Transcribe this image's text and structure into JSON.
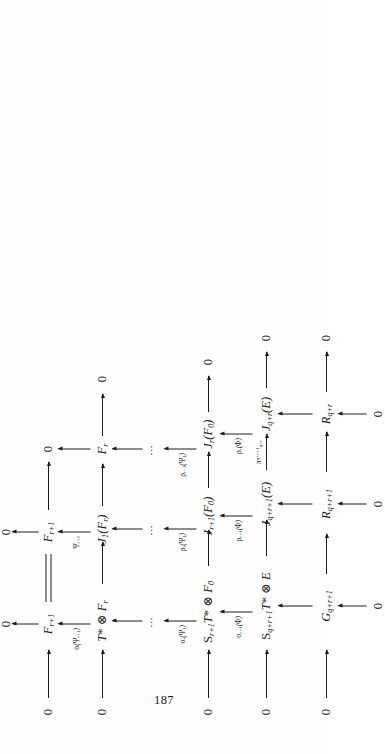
{
  "document": {
    "kind": "mathematical-commutative-diagram",
    "page_number": "187",
    "orientation": "rotated-90-ccw",
    "ink_color": "#1c1c1c",
    "paper_color": "#fefefe"
  },
  "diagram": {
    "rows": 5,
    "columns": 5,
    "zero_label": "0",
    "vdots_label": "⋯",
    "row_top": {
      "name": "row-F-r-plus-1",
      "nodes": [
        "0",
        "F_{r+1}",
        "F_{r+1}",
        "0"
      ],
      "node_plain": [
        "0",
        "F",
        "F",
        "0"
      ]
    },
    "nodes": [
      {
        "id": "n-r1-c1",
        "row": 1,
        "col": 1,
        "text": "0"
      },
      {
        "id": "n-r1-c2",
        "row": 1,
        "col": 2,
        "text": "F_{r+1}"
      },
      {
        "id": "n-r1-c3",
        "row": 1,
        "col": 3,
        "text": "F_{r+1}"
      },
      {
        "id": "n-r1-c4",
        "row": 1,
        "col": 4,
        "text": "0"
      },
      {
        "id": "n-r2-c1",
        "row": 2,
        "col": 1,
        "text": "0"
      },
      {
        "id": "n-r2-c2",
        "row": 2,
        "col": 2,
        "text": "T* ⊗ F_r"
      },
      {
        "id": "n-r2-c3",
        "row": 2,
        "col": 3,
        "text": "J_1(F_r)"
      },
      {
        "id": "n-r2-c4",
        "row": 2,
        "col": 4,
        "text": "F_r"
      },
      {
        "id": "n-r2-c5",
        "row": 2,
        "col": 5,
        "text": "0"
      },
      {
        "id": "n-r3-c1",
        "row": 3,
        "col": 1,
        "text": "0"
      },
      {
        "id": "n-r3-c2",
        "row": 3,
        "col": 2,
        "text": "S_{r+1}T* ⊗ F_0"
      },
      {
        "id": "n-r3-c3",
        "row": 3,
        "col": 3,
        "text": "J_{r+1}(F_0)"
      },
      {
        "id": "n-r3-c4",
        "row": 3,
        "col": 4,
        "text": "J_r(F_0)"
      },
      {
        "id": "n-r3-c5",
        "row": 3,
        "col": 5,
        "text": "0"
      },
      {
        "id": "n-r4-c1",
        "row": 4,
        "col": 1,
        "text": "0"
      },
      {
        "id": "n-r4-c2",
        "row": 4,
        "col": 2,
        "text": "S_{q+r+1}T* ⊗ E"
      },
      {
        "id": "n-r4-c3",
        "row": 4,
        "col": 3,
        "text": "J_{q+r+1}(E)"
      },
      {
        "id": "n-r4-c4",
        "row": 4,
        "col": 4,
        "text": "J_{q+r}(E)"
      },
      {
        "id": "n-r4-c5",
        "row": 4,
        "col": 5,
        "text": "0"
      },
      {
        "id": "n-r5-c1",
        "row": 5,
        "col": 1,
        "text": "0"
      },
      {
        "id": "n-r5-c2",
        "row": 5,
        "col": 2,
        "text": "G_{q+r+1}"
      },
      {
        "id": "n-r5-c3",
        "row": 5,
        "col": 3,
        "text": "R_{q+r+1}"
      },
      {
        "id": "n-r5-c4",
        "row": 5,
        "col": 4,
        "text": "R_{q+r}"
      },
      {
        "id": "n-r5-c5",
        "row": 5,
        "col": 5,
        "text": "0"
      },
      {
        "id": "n-r6-c2",
        "row": 6,
        "col": 2,
        "text": "0"
      },
      {
        "id": "n-r6-c3",
        "row": 6,
        "col": 3,
        "text": "0"
      },
      {
        "id": "n-r6-c4",
        "row": 6,
        "col": 4,
        "text": "0"
      }
    ],
    "vertical_labels": [
      {
        "id": "v-c2-r1r2",
        "text": "σ(Ψ_{r+1})"
      },
      {
        "id": "v-c3-r1r2",
        "text": "Ψ_{r+1}"
      },
      {
        "id": "v-c2-r2r3",
        "text": "σ_r(Ψ_1)"
      },
      {
        "id": "v-c3-r2r3",
        "text": "ρ_r(Ψ_1)"
      },
      {
        "id": "v-c4-r2r3",
        "text": "ρ_{r-1}(Ψ_1)"
      },
      {
        "id": "v-c2-r3r4",
        "text": "σ_{r+1}(Φ)"
      },
      {
        "id": "v-c3-r3r4",
        "text": "ρ_{r+1}(Φ)"
      },
      {
        "id": "v-c4-r3r4",
        "text": "ρ_r(Φ)"
      }
    ],
    "horizontal_labels": [
      {
        "id": "h-r4-c3c4",
        "text": "π^{q+r+1}_{q+r}"
      }
    ],
    "dots_positions": [
      "col2-row2-row3",
      "col3-row2-row3",
      "col4-row2-row3"
    ]
  },
  "folio": {
    "label": "187"
  }
}
